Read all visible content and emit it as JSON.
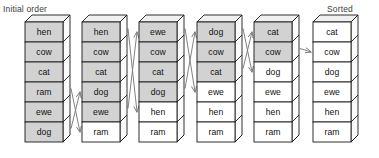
{
  "captions": {
    "initial": "Initial order",
    "sorted": "Sorted"
  },
  "colors": {
    "shaded_cell": "#d2d2d2",
    "plain_cell": "#ffffff",
    "box_top_face": "#f0f0f0",
    "box_side_face": "#fbfbfb",
    "outline": "#1a1a1a",
    "arrow": "#7a7a7a",
    "caption_text": "#3b3b3b",
    "cell_text": "#111111"
  },
  "chart_data": {
    "type": "diagram",
    "columns": [
      {
        "index": 0,
        "cells": [
          {
            "label": "hen",
            "shaded": true
          },
          {
            "label": "cow",
            "shaded": true
          },
          {
            "label": "cat",
            "shaded": true
          },
          {
            "label": "ram",
            "shaded": true
          },
          {
            "label": "ewe",
            "shaded": true
          },
          {
            "label": "dog",
            "shaded": true
          }
        ]
      },
      {
        "index": 1,
        "cells": [
          {
            "label": "hen",
            "shaded": true
          },
          {
            "label": "cow",
            "shaded": true
          },
          {
            "label": "cat",
            "shaded": true
          },
          {
            "label": "dog",
            "shaded": true
          },
          {
            "label": "ewe",
            "shaded": true
          },
          {
            "label": "ram",
            "shaded": false
          }
        ]
      },
      {
        "index": 2,
        "cells": [
          {
            "label": "ewe",
            "shaded": true
          },
          {
            "label": "cow",
            "shaded": true
          },
          {
            "label": "cat",
            "shaded": true
          },
          {
            "label": "dog",
            "shaded": true
          },
          {
            "label": "hen",
            "shaded": false
          },
          {
            "label": "ram",
            "shaded": false
          }
        ]
      },
      {
        "index": 3,
        "cells": [
          {
            "label": "dog",
            "shaded": true
          },
          {
            "label": "cow",
            "shaded": true
          },
          {
            "label": "cat",
            "shaded": true
          },
          {
            "label": "ewe",
            "shaded": false
          },
          {
            "label": "hen",
            "shaded": false
          },
          {
            "label": "ram",
            "shaded": false
          }
        ]
      },
      {
        "index": 4,
        "cells": [
          {
            "label": "cat",
            "shaded": true
          },
          {
            "label": "cow",
            "shaded": true
          },
          {
            "label": "dog",
            "shaded": false
          },
          {
            "label": "ewe",
            "shaded": false
          },
          {
            "label": "hen",
            "shaded": false
          },
          {
            "label": "ram",
            "shaded": false
          }
        ]
      },
      {
        "index": 5,
        "cells": [
          {
            "label": "cat",
            "shaded": false
          },
          {
            "label": "cow",
            "shaded": false
          },
          {
            "label": "dog",
            "shaded": false
          },
          {
            "label": "ewe",
            "shaded": false
          },
          {
            "label": "hen",
            "shaded": false
          },
          {
            "label": "ram",
            "shaded": false
          }
        ]
      }
    ],
    "arrows": [
      {
        "from_col": 0,
        "from_row": 3,
        "to_col": 1,
        "to_row": 5,
        "label": "ram"
      },
      {
        "from_col": 0,
        "from_row": 5,
        "to_col": 1,
        "to_row": 3,
        "label": "dog"
      },
      {
        "from_col": 1,
        "from_row": 0,
        "to_col": 2,
        "to_row": 4,
        "label": "hen"
      },
      {
        "from_col": 1,
        "from_row": 4,
        "to_col": 2,
        "to_row": 0,
        "label": "ewe"
      },
      {
        "from_col": 2,
        "from_row": 0,
        "to_col": 3,
        "to_row": 3,
        "label": "ewe"
      },
      {
        "from_col": 2,
        "from_row": 3,
        "to_col": 3,
        "to_row": 0,
        "label": "dog"
      },
      {
        "from_col": 3,
        "from_row": 0,
        "to_col": 4,
        "to_row": 2,
        "label": "dog"
      },
      {
        "from_col": 3,
        "from_row": 2,
        "to_col": 4,
        "to_row": 0,
        "label": "cat"
      },
      {
        "from_col": 4,
        "from_row": 1,
        "to_col": 5,
        "to_row": 1,
        "label": "cow"
      }
    ],
    "geometry": {
      "col_x": [
        25,
        82,
        139,
        197,
        254,
        313
      ],
      "top_y": 22,
      "cell_w": 38,
      "cell_h": 20,
      "depth": 7,
      "rows": 6
    }
  }
}
